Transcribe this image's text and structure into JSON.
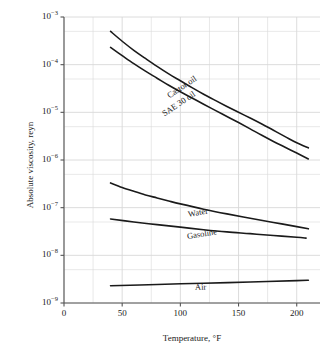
{
  "chart_data": {
    "type": "line",
    "title": "",
    "xlabel": "Temperature, °F",
    "ylabel": "Absolute viscosity, reyn",
    "xlim": [
      0,
      220
    ],
    "ylim": [
      1e-09,
      0.001
    ],
    "yscale": "log",
    "xscale": "linear",
    "grid": true,
    "legend_position": "inline-curve-labels",
    "xticks": [
      0,
      50,
      100,
      150,
      200
    ],
    "xtick_labels": [
      "0",
      "50",
      "100",
      "150",
      "200"
    ],
    "yticks": [
      0.001,
      0.0001,
      1e-05,
      1e-06,
      1e-07,
      1e-08,
      1e-09
    ],
    "ytick_labels": [
      "10−3",
      "10−4",
      "10−5",
      "10−6",
      "10−7",
      "10−8",
      "10−9"
    ],
    "ytick_mantissa": [
      "10",
      "10",
      "10",
      "10",
      "10",
      "10",
      "10"
    ],
    "ytick_exponents": [
      "−3",
      "−4",
      "−5",
      "−6",
      "−7",
      "−8",
      "−9"
    ],
    "series": [
      {
        "name": "Castor oil",
        "label": "Castor oil",
        "label_rotation": -34,
        "x": [
          40,
          50,
          60,
          70,
          80,
          90,
          100,
          110,
          120,
          130,
          140,
          150,
          160,
          170,
          180,
          190,
          200,
          210
        ],
        "y": [
          0.0005,
          0.00031,
          0.0002,
          0.000135,
          9.2e-05,
          6.4e-05,
          4.6e-05,
          3.3e-05,
          2.4e-05,
          1.78e-05,
          1.33e-05,
          1e-05,
          7.6e-06,
          5.7e-06,
          4.2e-06,
          3.1e-06,
          2.3e-06,
          1.8e-06
        ]
      },
      {
        "name": "SAE 30 oil",
        "label": "SAE 30 oil",
        "label_rotation": -34,
        "x": [
          40,
          50,
          60,
          70,
          80,
          90,
          100,
          110,
          120,
          130,
          140,
          150,
          160,
          170,
          180,
          190,
          200,
          210
        ],
        "y": [
          0.00023,
          0.000155,
          0.000105,
          7.3e-05,
          5.2e-05,
          3.7e-05,
          2.7e-05,
          2e-05,
          1.48e-05,
          1.1e-05,
          8.2e-06,
          6.1e-06,
          4.5e-06,
          3.3e-06,
          2.45e-06,
          1.85e-06,
          1.4e-06,
          1.05e-06
        ]
      },
      {
        "name": "Water",
        "label": "Water",
        "label_rotation": -10,
        "x": [
          40,
          50,
          60,
          70,
          80,
          90,
          100,
          120,
          140,
          160,
          180,
          200,
          210
        ],
        "y": [
          3.3e-07,
          2.65e-07,
          2.2e-07,
          1.85e-07,
          1.6e-07,
          1.38e-07,
          1.2e-07,
          9.3e-08,
          7.4e-08,
          6e-08,
          4.9e-08,
          4e-08,
          3.6e-08
        ]
      },
      {
        "name": "Gasoline",
        "label": "Gasoline",
        "label_rotation": -9,
        "x": [
          40,
          60,
          80,
          100,
          120,
          140,
          160,
          180,
          200,
          208
        ],
        "y": [
          5.8e-08,
          5e-08,
          4.4e-08,
          3.9e-08,
          3.45e-08,
          3.1e-08,
          2.85e-08,
          2.6e-08,
          2.4e-08,
          2.3e-08
        ]
      },
      {
        "name": "Air",
        "label": "Air",
        "label_rotation": -2,
        "x": [
          40,
          80,
          120,
          160,
          200,
          210
        ],
        "y": [
          2.3e-09,
          2.45e-09,
          2.6e-09,
          2.75e-09,
          2.95e-09,
          3e-09
        ]
      }
    ],
    "curve_label_positions": [
      {
        "name": "Castor oil",
        "x_px": 168,
        "y_px": 92
      },
      {
        "name": "SAE 30 oil",
        "x_px": 163,
        "y_px": 110
      },
      {
        "name": "Water",
        "x_px": 188,
        "y_px": 210
      },
      {
        "name": "Gasoline",
        "x_px": 187,
        "y_px": 232
      },
      {
        "name": "Air",
        "x_px": 195,
        "y_px": 283
      }
    ]
  },
  "style": {
    "line_color": "#1a1a1a",
    "grid_color": "#d8d8d8",
    "axis_color": "#555555",
    "background": "#ffffff"
  }
}
